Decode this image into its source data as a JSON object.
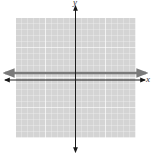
{
  "diagram": {
    "type": "coordinate-plane",
    "x_axis_label": "x",
    "y_axis_label": "y",
    "grid": {
      "xmin": -10,
      "xmax": 10,
      "ymin": -10,
      "ymax": 10,
      "step": 1,
      "major_every": 5
    },
    "graphed_line": {
      "equation": "y = 1",
      "color": "#7a7a7a"
    },
    "colors": {
      "grid_background": "#d4d4d4",
      "grid_minor": "#f2f2f2",
      "grid_major": "#ffffff",
      "axes": "#1a1a1a"
    }
  }
}
